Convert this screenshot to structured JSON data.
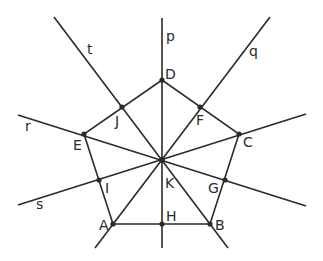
{
  "diagram": {
    "points": {
      "A": {
        "label": "A",
        "x": 113,
        "y": 224
      },
      "B": {
        "label": "B",
        "x": 210,
        "y": 224
      },
      "C": {
        "label": "C",
        "x": 239,
        "y": 134
      },
      "D": {
        "label": "D",
        "x": 162,
        "y": 80
      },
      "E": {
        "label": "E",
        "x": 84,
        "y": 134
      },
      "F": {
        "label": "F",
        "x": 200,
        "y": 107
      },
      "G": {
        "label": "G",
        "x": 225,
        "y": 180
      },
      "H": {
        "label": "H",
        "x": 162,
        "y": 224
      },
      "I": {
        "label": "I",
        "x": 99,
        "y": 180
      },
      "J": {
        "label": "J",
        "x": 122,
        "y": 107
      },
      "K": {
        "label": "K",
        "x": 162,
        "y": 160
      }
    },
    "lines": {
      "p": {
        "label": "p",
        "through": [
          "D",
          "K",
          "H"
        ]
      },
      "q": {
        "label": "q",
        "through": [
          "F",
          "K",
          "A"
        ]
      },
      "r": {
        "label": "r",
        "through": [
          "E",
          "K",
          "G"
        ]
      },
      "s": {
        "label": "s",
        "through": [
          "I",
          "K",
          "C"
        ]
      },
      "t": {
        "label": "t",
        "through": [
          "J",
          "K",
          "B"
        ]
      }
    },
    "pentagon": [
      "A",
      "B",
      "C",
      "D",
      "E"
    ],
    "stroke_color": "#2a2a2a"
  }
}
